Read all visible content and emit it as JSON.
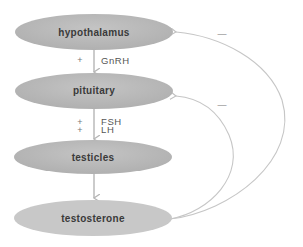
{
  "diagram": {
    "nodes": [
      {
        "id": "hypothalamus",
        "label": "hypothalamus"
      },
      {
        "id": "pituitary",
        "label": "pituitary"
      },
      {
        "id": "testicles",
        "label": "testicles"
      },
      {
        "id": "testosterone",
        "label": "testosterone"
      }
    ],
    "edges": [
      {
        "from": "hypothalamus",
        "to": "pituitary",
        "sign": "+",
        "label": "GnRH"
      },
      {
        "from": "pituitary",
        "to": "testicles",
        "signs": [
          "+",
          "+"
        ],
        "labels": [
          "FSH",
          "LH"
        ]
      },
      {
        "from": "testicles",
        "to": "testosterone",
        "sign": "",
        "label": ""
      }
    ],
    "feedback": [
      {
        "from": "testosterone",
        "to": "hypothalamus",
        "sign": "—"
      },
      {
        "from": "testosterone",
        "to": "pituitary",
        "sign": "—"
      }
    ],
    "colors": {
      "node_fill": "#b8b8b8",
      "node_fill_light": "#d4d4d4",
      "arrow": "#b5b5b5",
      "feedback_line": "#c6c6c6"
    }
  }
}
